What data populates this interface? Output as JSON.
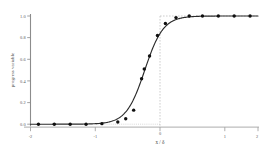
{
  "chart_data": {
    "type": "line",
    "title": "",
    "subtitle": "",
    "xlabel": "x / δ",
    "ylabel": "progress variable",
    "xlim": [
      -2.15,
      2.15
    ],
    "ylim": [
      -0.035,
      1.045
    ],
    "grid": false,
    "legend": null,
    "legend_position": "none",
    "x_ticks": [
      -2,
      -1,
      0,
      1,
      2
    ],
    "x_tick_labels": [
      "-2",
      "-1",
      "0",
      "1",
      "2"
    ],
    "y_ticks": [
      0.0,
      0.2,
      0.4,
      0.6,
      0.8,
      1.0
    ],
    "y_tick_labels": [
      "0.0",
      "0.2",
      "0.4",
      "0.6",
      "0.8",
      "1.0"
    ],
    "series": [
      {
        "name": "progress variable",
        "marker": "filled-circle",
        "marker_color": "#101010",
        "line_color": "#2b2b2b",
        "x": [
          -2.0,
          -1.7,
          -1.4,
          -1.1,
          -0.8,
          -0.5,
          -0.35,
          -0.2,
          -0.05,
          0.0,
          0.1,
          0.25,
          0.4,
          0.6,
          0.85,
          1.1,
          1.4,
          1.7,
          2.0
        ],
        "values": [
          0.0,
          0.0,
          0.0,
          0.0,
          0.005,
          0.02,
          0.05,
          0.13,
          0.42,
          0.51,
          0.63,
          0.82,
          0.93,
          0.985,
          1.0,
          1.0,
          1.0,
          1.0,
          1.0
        ]
      }
    ],
    "annotations": [
      {
        "name": "vertical-reference-line",
        "type": "vline",
        "x": 0.0,
        "style": "dashed",
        "color": "#b8b8b8"
      },
      {
        "name": "upper-reference-line",
        "type": "hline",
        "y": 1.0,
        "style": "dashed",
        "color": "#b8b8b8",
        "x_from": 0.0,
        "x_to": 2.15
      },
      {
        "name": "lower-reference-line",
        "type": "hline",
        "y": 0.0,
        "style": "dotted",
        "color": "#c8c8c8",
        "x_from": -0.55,
        "x_to": 0.0
      }
    ],
    "axis_colors": {
      "y_spine": "#8c8c8c",
      "x_baseline": "#bdbdbd",
      "tick_mark": "#8c8c8c"
    }
  }
}
